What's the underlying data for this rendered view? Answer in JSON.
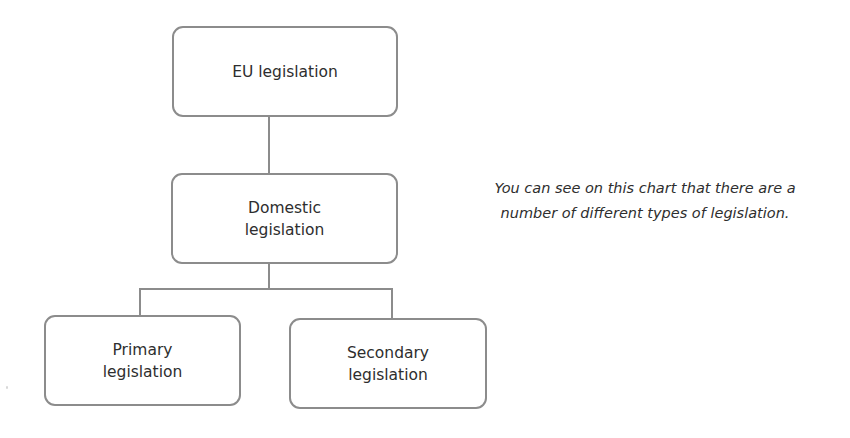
{
  "diagram": {
    "type": "hierarchy",
    "nodes": [
      {
        "id": "eu",
        "label_lines": [
          "EU legislation"
        ]
      },
      {
        "id": "domestic",
        "label_lines": [
          "Domestic",
          "legislation"
        ]
      },
      {
        "id": "primary",
        "label_lines": [
          "Primary",
          "legislation"
        ]
      },
      {
        "id": "secondary",
        "label_lines": [
          "Secondary",
          "legislation"
        ]
      }
    ],
    "edges": [
      {
        "from": "eu",
        "to": "domestic"
      },
      {
        "from": "domestic",
        "to": "primary"
      },
      {
        "from": "domestic",
        "to": "secondary"
      }
    ],
    "colors": {
      "border": "#8c8c8c",
      "text": "#2e2e2e",
      "background": "#ffffff"
    }
  },
  "caption": {
    "lines": [
      "You can see on this chart that there are a",
      "number of different types of legislation."
    ]
  }
}
